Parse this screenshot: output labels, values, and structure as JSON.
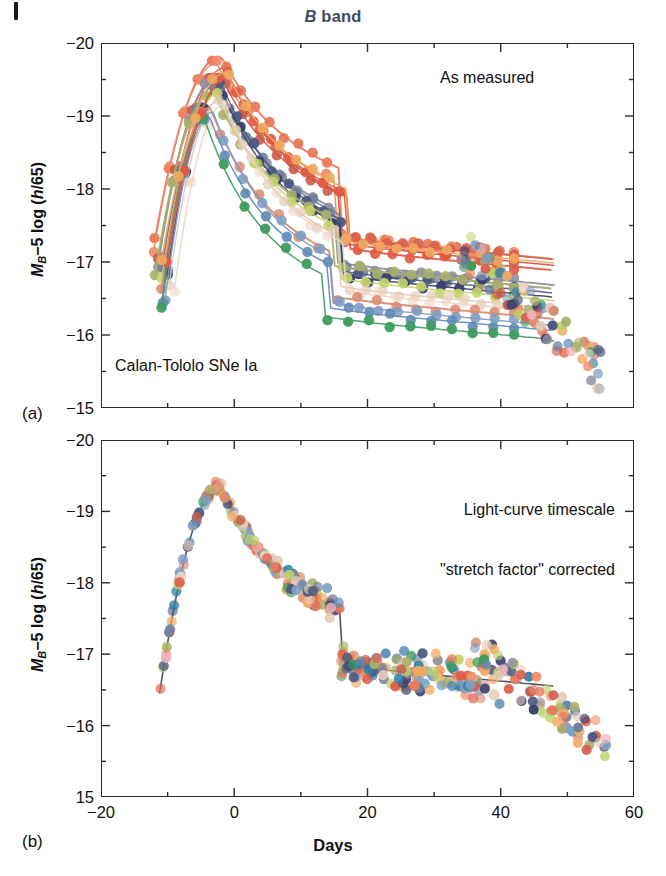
{
  "figure": {
    "title": "B band",
    "title_italic_part": "B",
    "title_rest": " band",
    "title_color": "#3f4a63",
    "xaxis_title": "Days",
    "yaxis_title_main": "M",
    "yaxis_title_sub": "B",
    "yaxis_title_rest": "−5 log (",
    "yaxis_title_italic": "h",
    "yaxis_title_tail": "/65)"
  },
  "panel_a": {
    "letter": "(a)",
    "annotation": "As measured",
    "subtitle": "Calan-Tololo SNe Ia",
    "x_ticks_major": [
      -20,
      0,
      20,
      40,
      60
    ],
    "x_tick_labels": [
      "",
      "",
      "",
      "",
      ""
    ],
    "x_ticks_minor": [
      -10,
      10,
      30,
      50
    ],
    "y_ticks_major": [
      -20,
      -19,
      -18,
      -17,
      -16,
      -15
    ],
    "y_tick_labels": [
      "−20",
      "−19",
      "−18",
      "−17",
      "−16",
      "−15"
    ],
    "y_ticks_minor": [
      -19.5,
      -18.5,
      -17.5,
      -16.5,
      -15.5
    ],
    "xlim": [
      -20,
      60
    ],
    "ylim": [
      -20,
      -15
    ]
  },
  "panel_b": {
    "letter": "(b)",
    "annotation_line1": "Light-curve timescale",
    "annotation_line2": "\"stretch factor\" corrected",
    "x_ticks_major": [
      -20,
      0,
      20,
      40,
      60
    ],
    "x_tick_labels": [
      "−20",
      "0",
      "20",
      "40",
      "60"
    ],
    "x_ticks_minor": [
      -10,
      10,
      30,
      50
    ],
    "y_ticks_major": [
      -20,
      -19,
      -18,
      -17,
      -16,
      -15
    ],
    "y_tick_labels": [
      "−20",
      "−19",
      "−18",
      "−17",
      "−16",
      "15"
    ],
    "y_ticks_minor": [
      -19.5,
      -18.5,
      -17.5,
      -16.5,
      -15.5
    ],
    "xlim": [
      -20,
      60
    ],
    "ylim": [
      -20,
      -15
    ]
  },
  "chart_data": {
    "type": "line",
    "title": "B band",
    "xlabel": "Days",
    "ylabel": "M_B −5 log (h/65)",
    "xlim": [
      -20,
      60
    ],
    "ylim": [
      -15,
      -20
    ],
    "y_inverted": true,
    "grid": false,
    "legend": "none",
    "panels": [
      {
        "id": "a",
        "label": "(a)",
        "note": "As measured",
        "subtitle": "Calan-Tololo SNe Ia",
        "description": "Individual Type Ia supernova B-band light curves with a spread of peak magnitudes and decline rates.",
        "series": [
          {
            "name": "sn01",
            "color": "#e8795a",
            "peak_mag": -19.82,
            "peak_day": -2.0,
            "rise_width": 9.5,
            "decline_rate": 0.092,
            "tail_mag": -16.85,
            "npoints": 26,
            "point_alpha": 0.95
          },
          {
            "name": "sn02",
            "color": "#ef8a64",
            "peak_mag": -19.72,
            "peak_day": -2.6,
            "rise_width": 9.0,
            "decline_rate": 0.098,
            "tail_mag": -16.95,
            "npoints": 24,
            "point_alpha": 0.9
          },
          {
            "name": "sn03",
            "color": "#d8604f",
            "peak_mag": -19.66,
            "peak_day": -1.5,
            "rise_width": 8.6,
            "decline_rate": 0.104,
            "tail_mag": -17.0,
            "npoints": 23,
            "point_alpha": 0.9
          },
          {
            "name": "sn04",
            "color": "#c9543f",
            "peak_mag": -19.58,
            "peak_day": -2.2,
            "rise_width": 8.8,
            "decline_rate": 0.1,
            "tail_mag": -16.9,
            "npoints": 22,
            "point_alpha": 0.85
          },
          {
            "name": "sn05",
            "color": "#8f8f9e",
            "peak_mag": -19.5,
            "peak_day": -2.8,
            "rise_width": 8.2,
            "decline_rate": 0.11,
            "tail_mag": -16.6,
            "npoints": 24,
            "point_alpha": 0.9
          },
          {
            "name": "sn06",
            "color": "#6f7f9b",
            "peak_mag": -19.46,
            "peak_day": -2.4,
            "rise_width": 8.0,
            "decline_rate": 0.112,
            "tail_mag": -16.55,
            "npoints": 22,
            "point_alpha": 0.9
          },
          {
            "name": "sn07",
            "color": "#4c5a80",
            "peak_mag": -19.42,
            "peak_day": -1.8,
            "rise_width": 7.8,
            "decline_rate": 0.116,
            "tail_mag": -16.5,
            "npoints": 21,
            "point_alpha": 0.95
          },
          {
            "name": "sn08",
            "color": "#3b3f6e",
            "peak_mag": -19.38,
            "peak_day": -2.0,
            "rise_width": 7.6,
            "decline_rate": 0.118,
            "tail_mag": -16.45,
            "npoints": 20,
            "point_alpha": 0.95
          },
          {
            "name": "sn09",
            "color": "#a8b06a",
            "peak_mag": -19.34,
            "peak_day": -3.1,
            "rise_width": 8.4,
            "decline_rate": 0.108,
            "tail_mag": -16.6,
            "npoints": 22,
            "point_alpha": 0.9
          },
          {
            "name": "sn10",
            "color": "#c6d46a",
            "peak_mag": -19.3,
            "peak_day": -2.5,
            "rise_width": 8.0,
            "decline_rate": 0.114,
            "tail_mag": -16.4,
            "npoints": 20,
            "point_alpha": 0.9
          },
          {
            "name": "sn11",
            "color": "#e2c9b6",
            "peak_mag": -19.24,
            "peak_day": -2.0,
            "rise_width": 7.4,
            "decline_rate": 0.12,
            "tail_mag": -16.3,
            "npoints": 22,
            "point_alpha": 0.65
          },
          {
            "name": "sn12",
            "color": "#edd6c4",
            "peak_mag": -19.18,
            "peak_day": -1.4,
            "rise_width": 7.2,
            "decline_rate": 0.122,
            "tail_mag": -16.25,
            "npoints": 21,
            "point_alpha": 0.6
          },
          {
            "name": "sn13",
            "color": "#d98a6e",
            "peak_mag": -19.12,
            "peak_day": -3.6,
            "rise_width": 7.0,
            "decline_rate": 0.126,
            "tail_mag": -16.2,
            "npoints": 19,
            "point_alpha": 0.85
          },
          {
            "name": "sn14",
            "color": "#7f9fc4",
            "peak_mag": -19.06,
            "peak_day": -3.2,
            "rise_width": 6.8,
            "decline_rate": 0.128,
            "tail_mag": -16.1,
            "npoints": 19,
            "point_alpha": 0.9
          },
          {
            "name": "sn15",
            "color": "#5f8ab5",
            "peak_mag": -19.02,
            "peak_day": -3.8,
            "rise_width": 6.6,
            "decline_rate": 0.132,
            "tail_mag": -16.05,
            "npoints": 18,
            "point_alpha": 0.9
          },
          {
            "name": "sn16",
            "color": "#3f9b5e",
            "peak_mag": -18.94,
            "peak_day": -4.4,
            "rise_width": 6.2,
            "decline_rate": 0.138,
            "tail_mag": -15.95,
            "npoints": 18,
            "point_alpha": 0.95
          },
          {
            "name": "sn17",
            "color": "#e05a45",
            "peak_mag": -19.55,
            "peak_day": -0.8,
            "rise_width": 8.9,
            "decline_rate": 0.101,
            "tail_mag": -16.8,
            "npoints": 21,
            "point_alpha": 0.92
          },
          {
            "name": "sn18",
            "color": "#f0a95f",
            "peak_mag": -19.6,
            "peak_day": -1.2,
            "rise_width": 9.2,
            "decline_rate": 0.096,
            "tail_mag": -16.9,
            "npoints": 22,
            "point_alpha": 0.9
          }
        ],
        "tail_scatter_days": [
          34,
          35,
          36,
          37,
          38,
          38.5,
          39,
          40,
          41,
          42,
          43,
          43.5,
          44,
          45,
          46,
          47,
          48,
          49,
          50,
          51,
          52,
          53,
          54,
          55
        ],
        "tail_scatter_mag_range": [
          -17.2,
          -15.5
        ]
      },
      {
        "id": "b",
        "label": "(b)",
        "note": "Light-curve timescale \"stretch factor\" corrected",
        "description": "The same supernovae after light-curve timescale stretch-factor correction collapse onto a single template.",
        "template": {
          "color": "#444444",
          "peak_mag": -19.35,
          "peak_day": -2.0,
          "rise_width": 8.2,
          "decline_rate": 0.107,
          "tail_mag": -16.45
        },
        "scatter_sigma_mag": 0.09,
        "tail_scatter_days": [
          36,
          38,
          40,
          41,
          42,
          43,
          44,
          45,
          46,
          47,
          48,
          49,
          50,
          51,
          52,
          53,
          54,
          55,
          56
        ],
        "tail_scatter_mag_range": [
          -17.1,
          -15.7
        ]
      }
    ],
    "point_palette": [
      "#e8795a",
      "#ef8a64",
      "#d8604f",
      "#c9543f",
      "#e05a45",
      "#f0a95f",
      "#8f8f9e",
      "#6f7f9b",
      "#4c5a80",
      "#3b3f6e",
      "#a8b06a",
      "#c6d46a",
      "#e2c9b6",
      "#edd6c4",
      "#d98a6e",
      "#7f9fc4",
      "#5f8ab5",
      "#3f9b5e",
      "#efb2c0",
      "#b8d46a",
      "#f2b06a",
      "#2f7fa8"
    ]
  }
}
